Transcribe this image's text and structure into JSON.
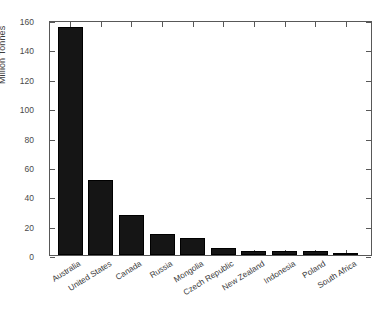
{
  "chart_data": {
    "type": "bar",
    "title": "",
    "subtitle": "",
    "xlabel": "",
    "ylabel": "Million Tonnes",
    "categories": [
      "Australia",
      "United States",
      "Canada",
      "Russia",
      "Mongolia",
      "Czech Republic",
      "New Zealand",
      "Indonesia",
      "Poland",
      "South Africa"
    ],
    "values": [
      155,
      51,
      27,
      14.5,
      11.5,
      4.5,
      2.5,
      2.5,
      2.5,
      1.7
    ],
    "ylim": [
      0,
      160
    ],
    "yticks": [
      0,
      20,
      40,
      60,
      80,
      100,
      120,
      140,
      160
    ],
    "ytick_labels": [
      "0",
      "20",
      "40",
      "60",
      "80",
      "100",
      "120",
      "140",
      "160"
    ],
    "grid": false,
    "legend": null,
    "legend_position": "none",
    "bar_color": "#151515",
    "axis_color": "#585858",
    "text_color": "#3a3a3a",
    "background_color": "#ffffff",
    "xtick_label_rotation": -32
  }
}
